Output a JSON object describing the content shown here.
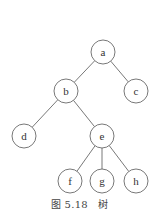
{
  "figure": {
    "caption_number": "图 5.18",
    "caption_title": "树"
  },
  "tree": {
    "node_radius": 12,
    "stroke_color": "#555555",
    "nodes": [
      {
        "id": "a",
        "label": "a",
        "x": 103,
        "y": 52
      },
      {
        "id": "b",
        "label": "b",
        "x": 66,
        "y": 91
      },
      {
        "id": "c",
        "label": "c",
        "x": 136,
        "y": 91
      },
      {
        "id": "d",
        "label": "d",
        "x": 24,
        "y": 136
      },
      {
        "id": "e",
        "label": "e",
        "x": 102,
        "y": 136
      },
      {
        "id": "f",
        "label": "f",
        "x": 70,
        "y": 181
      },
      {
        "id": "g",
        "label": "g",
        "x": 102,
        "y": 181
      },
      {
        "id": "h",
        "label": "h",
        "x": 136,
        "y": 181
      }
    ],
    "edges": [
      {
        "from": "a",
        "to": "b"
      },
      {
        "from": "a",
        "to": "c"
      },
      {
        "from": "b",
        "to": "d"
      },
      {
        "from": "b",
        "to": "e"
      },
      {
        "from": "e",
        "to": "f"
      },
      {
        "from": "e",
        "to": "g"
      },
      {
        "from": "e",
        "to": "h"
      }
    ]
  }
}
